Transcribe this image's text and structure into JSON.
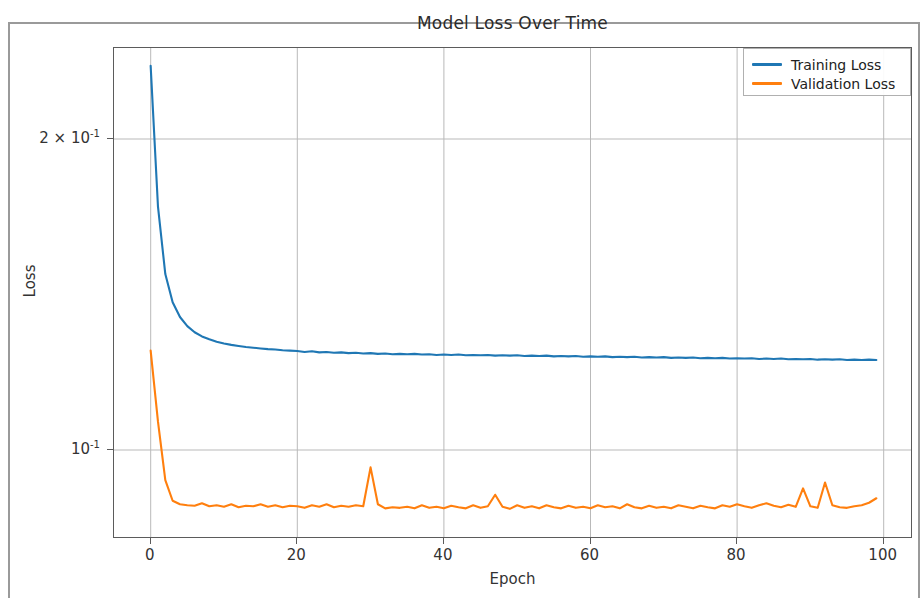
{
  "figure": {
    "title": "Model Loss Over Time",
    "xlabel": "Epoch",
    "ylabel": "Loss"
  },
  "axes": {
    "x_tick_labels": [
      "0",
      "20",
      "40",
      "60",
      "80",
      "100"
    ],
    "y_tick_labels": [
      "2 × 10",
      "10"
    ],
    "y_tick_exponents": [
      "-1",
      "-1"
    ]
  },
  "legend": {
    "items": [
      {
        "label": "Training Loss",
        "color": "#1f77b4"
      },
      {
        "label": "Validation Loss",
        "color": "#ff7f0e"
      }
    ]
  },
  "chart_data": {
    "type": "line",
    "title": "Model Loss Over Time",
    "xlabel": "Epoch",
    "ylabel": "Loss",
    "xlim": [
      -5,
      104
    ],
    "ylim": [
      0.082,
      0.245
    ],
    "yscale": "log",
    "xscale": "linear",
    "grid": true,
    "legend_position": "upper right",
    "x_ticks": [
      0,
      20,
      40,
      60,
      80,
      100
    ],
    "y_ticks": [
      0.1,
      0.2
    ],
    "y_tick_text": [
      "10^-1",
      "2 x 10^-1"
    ],
    "x": [
      0,
      1,
      2,
      3,
      4,
      5,
      6,
      7,
      8,
      9,
      10,
      11,
      12,
      13,
      14,
      15,
      16,
      17,
      18,
      19,
      20,
      21,
      22,
      23,
      24,
      25,
      26,
      27,
      28,
      29,
      30,
      31,
      32,
      33,
      34,
      35,
      36,
      37,
      38,
      39,
      40,
      41,
      42,
      43,
      44,
      45,
      46,
      47,
      48,
      49,
      50,
      51,
      52,
      53,
      54,
      55,
      56,
      57,
      58,
      59,
      60,
      61,
      62,
      63,
      64,
      65,
      66,
      67,
      68,
      69,
      70,
      71,
      72,
      73,
      74,
      75,
      76,
      77,
      78,
      79,
      80,
      81,
      82,
      83,
      84,
      85,
      86,
      87,
      88,
      89,
      90,
      91,
      92,
      93,
      94,
      95,
      96,
      97,
      98,
      99
    ],
    "series": [
      {
        "name": "Training Loss",
        "color": "#1f77b4",
        "values": [
          0.2355,
          0.172,
          0.148,
          0.139,
          0.1345,
          0.1318,
          0.13,
          0.1288,
          0.128,
          0.1273,
          0.1268,
          0.1264,
          0.1261,
          0.1258,
          0.1256,
          0.1254,
          0.1252,
          0.1251,
          0.1249,
          0.1248,
          0.1247,
          0.1244,
          0.1246,
          0.1243,
          0.1244,
          0.1242,
          0.1243,
          0.1241,
          0.1242,
          0.124,
          0.1241,
          0.1239,
          0.124,
          0.1238,
          0.1239,
          0.1238,
          0.1239,
          0.1237,
          0.1238,
          0.1236,
          0.1237,
          0.1236,
          0.1237,
          0.1235,
          0.1236,
          0.1235,
          0.1236,
          0.1234,
          0.1235,
          0.1234,
          0.1235,
          0.1233,
          0.1234,
          0.1233,
          0.1234,
          0.1232,
          0.1233,
          0.1232,
          0.1233,
          0.1231,
          0.1232,
          0.1231,
          0.1232,
          0.123,
          0.1231,
          0.123,
          0.1231,
          0.1229,
          0.123,
          0.1229,
          0.123,
          0.1228,
          0.1229,
          0.1228,
          0.1229,
          0.1227,
          0.1228,
          0.1227,
          0.1228,
          0.1226,
          0.1227,
          0.1226,
          0.1227,
          0.1225,
          0.1226,
          0.1225,
          0.1226,
          0.1224,
          0.1225,
          0.1224,
          0.1225,
          0.1223,
          0.1224,
          0.1223,
          0.1224,
          0.1222,
          0.1223,
          0.1222,
          0.1223,
          0.1222
        ]
      },
      {
        "name": "Validation Loss",
        "color": "#ff7f0e",
        "values": [
          0.1248,
          0.1065,
          0.0935,
          0.0893,
          0.0886,
          0.0884,
          0.0883,
          0.0888,
          0.0882,
          0.0884,
          0.0881,
          0.0886,
          0.088,
          0.0883,
          0.0882,
          0.0886,
          0.0881,
          0.0884,
          0.088,
          0.0883,
          0.0882,
          0.0879,
          0.0884,
          0.0881,
          0.0886,
          0.088,
          0.0883,
          0.0881,
          0.0884,
          0.0882,
          0.0962,
          0.0886,
          0.0878,
          0.088,
          0.0879,
          0.0881,
          0.0878,
          0.0884,
          0.0879,
          0.0881,
          0.0878,
          0.0883,
          0.088,
          0.0878,
          0.0884,
          0.0879,
          0.0882,
          0.0905,
          0.0881,
          0.0877,
          0.0884,
          0.0879,
          0.0882,
          0.0878,
          0.0884,
          0.088,
          0.0878,
          0.0883,
          0.0879,
          0.0881,
          0.0878,
          0.0884,
          0.088,
          0.0882,
          0.0878,
          0.0886,
          0.088,
          0.0878,
          0.0883,
          0.0879,
          0.0881,
          0.0878,
          0.0884,
          0.0881,
          0.0878,
          0.0883,
          0.088,
          0.0878,
          0.0884,
          0.0881,
          0.0886,
          0.0882,
          0.0879,
          0.0884,
          0.0888,
          0.0883,
          0.088,
          0.0885,
          0.0881,
          0.0918,
          0.0882,
          0.0879,
          0.093,
          0.0884,
          0.088,
          0.0879,
          0.0882,
          0.0884,
          0.0889,
          0.0898
        ]
      }
    ]
  }
}
